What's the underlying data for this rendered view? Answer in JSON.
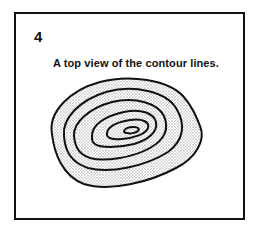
{
  "panel": {
    "number": "4",
    "caption": "A top view of the contour lines."
  },
  "diagram": {
    "type": "contour-map-top-view",
    "contour_count": 6,
    "stroke_color": "#111111",
    "shading_color": "#c8c8c8"
  }
}
